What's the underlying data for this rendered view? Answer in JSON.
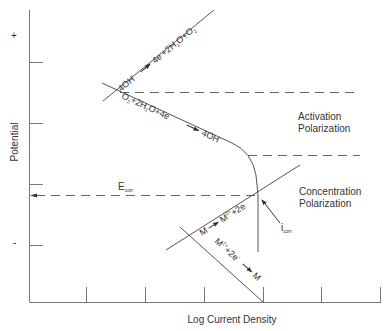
{
  "diagram": {
    "type": "evans-diagram",
    "axes": {
      "y_label": "Potential",
      "x_label": "Log Current Density",
      "y_plus": "+",
      "y_minus": "-"
    },
    "regions": {
      "activation_line1": "Activation",
      "activation_line2": "Polarization",
      "concentration_line1": "Concentration",
      "concentration_line2": "Polarization"
    },
    "reactions": {
      "oxygen_anodic": {
        "left": "4OH",
        "left_sup": "-",
        "right_a": "4e",
        "right_a_sup": "-",
        "right_b": "+2H",
        "right_b_sub": "2",
        "right_c": "O+O",
        "right_c_sub": "2"
      },
      "oxygen_cathodic": {
        "a": "O",
        "a_sub": "2",
        "b": "+2H",
        "b_sub": "2",
        "c": "O+4e",
        "c_sup": "-",
        "product": "4OH",
        "product_sup": "-"
      },
      "metal_anodic": {
        "left": "M",
        "right": "M",
        "right_sup": "2+",
        "tail": "+2e",
        "tail_sup": "-"
      },
      "metal_cathodic": {
        "left": "M",
        "left_sup": "2+",
        "mid": "+2e",
        "mid_sup": "-",
        "product": "M"
      }
    },
    "annotations": {
      "e_corr": "E",
      "e_corr_sub": "corr",
      "i_corr": "i",
      "i_corr_sub": "corr"
    },
    "colors": {
      "line": "#555555",
      "axis": "#777777",
      "text": "#333333",
      "background": "#ffffff"
    }
  }
}
